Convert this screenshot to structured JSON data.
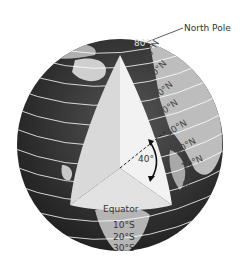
{
  "diagram": {
    "title_label": "North Pole",
    "angle_label": "40°",
    "equator_label": "Equator",
    "latitude_labels_north": [
      "80°N",
      "70°N",
      "60°N",
      "50°N",
      "40°N",
      "30°N",
      "20°N",
      "10°N",
      "0°"
    ],
    "latitude_labels_south": [
      "10°S",
      "20°S",
      "30°S"
    ],
    "colors": {
      "globe_dark": "#2a2a2a",
      "land": "#bdbdbd",
      "wedge_light": "#f2f2f2",
      "wedge_mid": "#d9d9d9",
      "wedge_dark": "#c4c4c4",
      "lines": "#ffffff",
      "text": "#333333"
    }
  }
}
